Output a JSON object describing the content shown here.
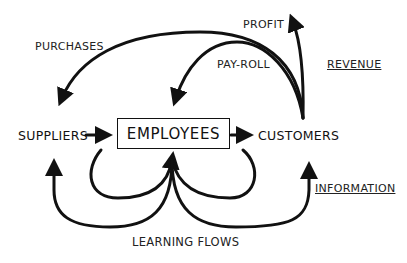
{
  "diagram": {
    "nodes": {
      "suppliers": "SUPPLIERS",
      "employees": "EMPLOYEES",
      "customers": "CUSTOMERS"
    },
    "flow_labels": {
      "purchases": "PURCHASES",
      "profit": "PROFIT",
      "payroll": "PAY-ROLL",
      "learning_flows": "LEARNING FLOWS"
    },
    "category_labels": {
      "revenue": "REVENUE",
      "information": "INFORMATION"
    },
    "edges": [
      {
        "from": "SUPPLIERS",
        "to": "EMPLOYEES"
      },
      {
        "from": "EMPLOYEES",
        "to": "CUSTOMERS"
      },
      {
        "from": "CUSTOMERS",
        "to": "SUPPLIERS",
        "label": "PURCHASES"
      },
      {
        "from": "CUSTOMERS",
        "to": "EMPLOYEES",
        "label": "PAY-ROLL"
      },
      {
        "from": "CUSTOMERS",
        "to": "PROFIT",
        "label": "PROFIT"
      },
      {
        "from": "EMPLOYEES",
        "to": "SUPPLIERS",
        "label": "LEARNING FLOWS"
      },
      {
        "from": "EMPLOYEES",
        "to": "CUSTOMERS",
        "label": "LEARNING FLOWS"
      },
      {
        "from": "LEARNING FLOWS",
        "to": "EMPLOYEES"
      }
    ],
    "colors": {
      "stroke": "#111111",
      "background": "#ffffff"
    }
  }
}
